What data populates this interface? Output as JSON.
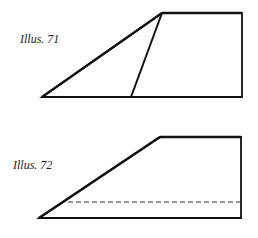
{
  "figures": [
    {
      "label": "Illus. 71",
      "shape": "trapezoid with inner diagonal fold line",
      "stroke_color": "#111111"
    },
    {
      "label": "Illus. 72",
      "shape": "trapezoid with dashed fold line",
      "stroke_color": "#111111",
      "dash_color": "#333333"
    }
  ]
}
